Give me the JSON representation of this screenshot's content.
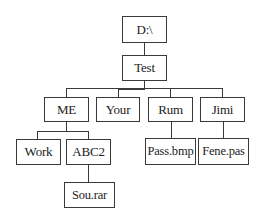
{
  "diagram": {
    "type": "directory-tree",
    "root": "D:\\",
    "nodes": {
      "root": "D:\\",
      "test": "Test",
      "me": "ME",
      "your": "Your",
      "rum": "Rum",
      "jimi": "Jimi",
      "work": "Work",
      "abc2": "ABC2",
      "pass": "Pass.bmp",
      "fene": "Fene.pas",
      "sou": "Sou.rar"
    },
    "edges": [
      [
        "D:\\",
        "Test"
      ],
      [
        "Test",
        "ME"
      ],
      [
        "Test",
        "Your"
      ],
      [
        "Test",
        "Rum"
      ],
      [
        "Test",
        "Jimi"
      ],
      [
        "ME",
        "Work"
      ],
      [
        "ME",
        "ABC2"
      ],
      [
        "ABC2",
        "Sou.rar"
      ],
      [
        "Rum",
        "Pass.bmp"
      ],
      [
        "Jimi",
        "Fene.pas"
      ]
    ]
  }
}
